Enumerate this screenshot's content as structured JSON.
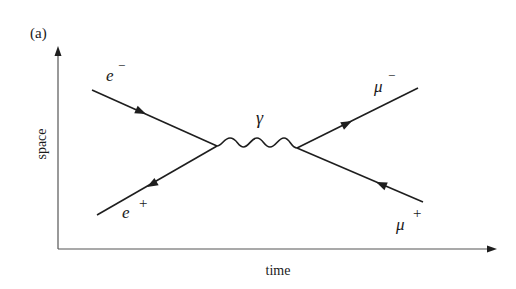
{
  "figure": {
    "panel_label": "(a)",
    "axes": {
      "x_label": "time",
      "y_label": "space"
    },
    "particles": {
      "incoming_electron": {
        "symbol": "e",
        "charge": "−"
      },
      "incoming_positron": {
        "symbol": "e",
        "charge": "+"
      },
      "photon": {
        "symbol": "γ"
      },
      "outgoing_muon": {
        "symbol": "μ",
        "charge": "−"
      },
      "outgoing_antimuon": {
        "symbol": "μ",
        "charge": "+"
      }
    },
    "colors": {
      "line": "#1e1e1e",
      "axis": "#555555",
      "background": "#ffffff"
    }
  }
}
